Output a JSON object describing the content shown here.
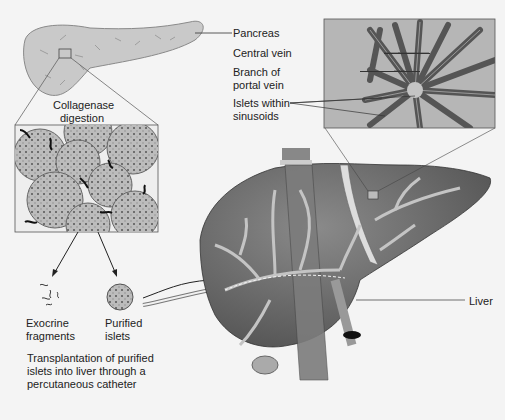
{
  "labels": {
    "pancreas": "Pancreas",
    "central_vein": "Central vein",
    "branch_portal_1": "Branch of",
    "branch_portal_2": "portal vein",
    "islets_sinusoids_1": "Islets within",
    "islets_sinusoids_2": "sinusoids",
    "collagenase_1": "Collagenase",
    "collagenase_2": "digestion",
    "exocrine_1": "Exocrine",
    "exocrine_2": "fragments",
    "purified_1": "Purified",
    "purified_2": "islets",
    "transplant_1": "Transplantation of purified",
    "transplant_2": "islets into liver through a",
    "transplant_3": "percutaneous catheter",
    "liver": "Liver"
  },
  "colors": {
    "background": "#f4f4f4",
    "pancreas_fill": "#c8c8c8",
    "liver_fill": "#6e6e6e",
    "vessel_fill": "#bdbdbd",
    "inset_bg": "#b4b4b4",
    "cell_fill": "#7a7a7a",
    "line": "#333333"
  }
}
